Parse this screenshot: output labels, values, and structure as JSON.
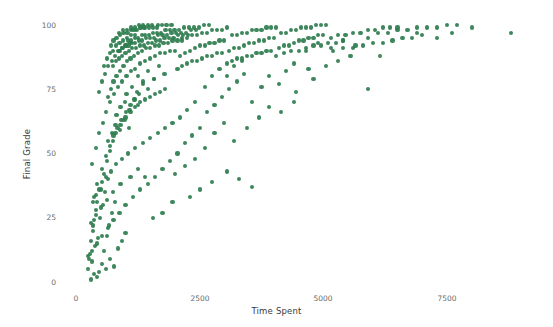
{
  "chart_data": {
    "type": "scatter",
    "title": "",
    "xlabel": "Time Spent",
    "ylabel": "Final Grade",
    "xlim": [
      -320,
      9400
    ],
    "ylim": [
      -5,
      105
    ],
    "xticks": [
      0,
      2500,
      5000,
      7500
    ],
    "xtick_labels": [
      "0",
      "2500",
      "5000",
      "7500"
    ],
    "yticks": [
      0,
      25,
      50,
      75,
      100
    ],
    "ytick_labels": [
      "0",
      "25",
      "50",
      "75",
      "100"
    ],
    "grid": false,
    "legend": false,
    "marker_color": "#2e7d4f",
    "marker_size": 4,
    "background_color": "#ffffff",
    "n_points": 470,
    "points": [
      [
        300,
        1
      ],
      [
        360,
        3
      ],
      [
        250,
        5
      ],
      [
        420,
        2
      ],
      [
        330,
        8
      ],
      [
        470,
        4
      ],
      [
        280,
        11
      ],
      [
        520,
        7
      ],
      [
        390,
        14
      ],
      [
        600,
        5
      ],
      [
        450,
        17
      ],
      [
        340,
        20
      ],
      [
        560,
        12
      ],
      [
        690,
        9
      ],
      [
        300,
        23
      ],
      [
        480,
        25
      ],
      [
        620,
        18
      ],
      [
        770,
        6
      ],
      [
        410,
        28
      ],
      [
        540,
        30
      ],
      [
        660,
        22
      ],
      [
        850,
        13
      ],
      [
        360,
        33
      ],
      [
        580,
        35
      ],
      [
        720,
        27
      ],
      [
        930,
        16
      ],
      [
        430,
        38
      ],
      [
        640,
        40
      ],
      [
        790,
        31
      ],
      [
        1000,
        19
      ],
      [
        250,
        10
      ],
      [
        310,
        16
      ],
      [
        370,
        24
      ],
      [
        430,
        31
      ],
      [
        500,
        36
      ],
      [
        560,
        42
      ],
      [
        620,
        47
      ],
      [
        680,
        51
      ],
      [
        740,
        55
      ],
      [
        800,
        58
      ],
      [
        900,
        61
      ],
      [
        1000,
        64
      ],
      [
        1100,
        66
      ],
      [
        1200,
        68
      ],
      [
        1300,
        70
      ],
      [
        1400,
        71
      ],
      [
        1500,
        72
      ],
      [
        1600,
        73
      ],
      [
        1700,
        74
      ],
      [
        1800,
        75
      ],
      [
        520,
        44
      ],
      [
        600,
        49
      ],
      [
        680,
        53
      ],
      [
        760,
        57
      ],
      [
        840,
        60
      ],
      [
        920,
        63
      ],
      [
        1010,
        66
      ],
      [
        1100,
        69
      ],
      [
        1190,
        71
      ],
      [
        1280,
        73
      ],
      [
        330,
        46
      ],
      [
        400,
        52
      ],
      [
        470,
        58
      ],
      [
        540,
        62
      ],
      [
        610,
        66
      ],
      [
        690,
        70
      ],
      [
        770,
        73
      ],
      [
        850,
        76
      ],
      [
        930,
        78
      ],
      [
        1020,
        80
      ],
      [
        1110,
        82
      ],
      [
        1200,
        83
      ],
      [
        1300,
        85
      ],
      [
        1400,
        86
      ],
      [
        1500,
        87
      ],
      [
        1600,
        88
      ],
      [
        1700,
        89
      ],
      [
        1800,
        89
      ],
      [
        1900,
        90
      ],
      [
        2000,
        90
      ],
      [
        640,
        72
      ],
      [
        700,
        75
      ],
      [
        760,
        78
      ],
      [
        820,
        80
      ],
      [
        890,
        82
      ],
      [
        960,
        84
      ],
      [
        1030,
        86
      ],
      [
        1100,
        87
      ],
      [
        1180,
        88
      ],
      [
        1260,
        89
      ],
      [
        1340,
        90
      ],
      [
        1420,
        91
      ],
      [
        1500,
        91
      ],
      [
        1590,
        92
      ],
      [
        1680,
        92
      ],
      [
        1770,
        93
      ],
      [
        1860,
        93
      ],
      [
        1950,
        94
      ],
      [
        2050,
        94
      ],
      [
        2150,
        94
      ],
      [
        750,
        84
      ],
      [
        810,
        86
      ],
      [
        870,
        87
      ],
      [
        930,
        88
      ],
      [
        1000,
        89
      ],
      [
        1070,
        90
      ],
      [
        1140,
        91
      ],
      [
        1210,
        91
      ],
      [
        1290,
        92
      ],
      [
        1370,
        92
      ],
      [
        1450,
        93
      ],
      [
        1530,
        93
      ],
      [
        1610,
        94
      ],
      [
        1700,
        94
      ],
      [
        1790,
        95
      ],
      [
        1880,
        95
      ],
      [
        1970,
        95
      ],
      [
        2060,
        96
      ],
      [
        2160,
        96
      ],
      [
        2260,
        96
      ],
      [
        880,
        90
      ],
      [
        940,
        91
      ],
      [
        1000,
        92
      ],
      [
        1060,
        92
      ],
      [
        1130,
        93
      ],
      [
        1200,
        93
      ],
      [
        1270,
        94
      ],
      [
        1340,
        94
      ],
      [
        1420,
        95
      ],
      [
        1500,
        95
      ],
      [
        1580,
        95
      ],
      [
        1660,
        96
      ],
      [
        1750,
        96
      ],
      [
        1840,
        96
      ],
      [
        1930,
        97
      ],
      [
        2020,
        97
      ],
      [
        2120,
        97
      ],
      [
        2220,
        97
      ],
      [
        2320,
        98
      ],
      [
        2420,
        98
      ],
      [
        1050,
        94
      ],
      [
        1120,
        94
      ],
      [
        1190,
        95
      ],
      [
        1260,
        95
      ],
      [
        1330,
        96
      ],
      [
        1400,
        96
      ],
      [
        1480,
        96
      ],
      [
        1560,
        97
      ],
      [
        1640,
        97
      ],
      [
        1720,
        97
      ],
      [
        1810,
        98
      ],
      [
        1900,
        98
      ],
      [
        1990,
        98
      ],
      [
        2080,
        98
      ],
      [
        2180,
        99
      ],
      [
        2280,
        99
      ],
      [
        2380,
        99
      ],
      [
        2480,
        99
      ],
      [
        2580,
        100
      ],
      [
        2690,
        100
      ],
      [
        1150,
        98
      ],
      [
        1230,
        98
      ],
      [
        1310,
        99
      ],
      [
        1390,
        99
      ],
      [
        1470,
        99
      ],
      [
        1560,
        99
      ],
      [
        1650,
        100
      ],
      [
        1740,
        100
      ],
      [
        1830,
        100
      ],
      [
        1930,
        100
      ],
      [
        870,
        97
      ],
      [
        950,
        98
      ],
      [
        1030,
        98
      ],
      [
        1110,
        99
      ],
      [
        1190,
        99
      ],
      [
        1270,
        100
      ],
      [
        1360,
        100
      ],
      [
        1450,
        100
      ],
      [
        1540,
        100
      ],
      [
        1640,
        99
      ],
      [
        700,
        92
      ],
      [
        760,
        94
      ],
      [
        820,
        95
      ],
      [
        890,
        96
      ],
      [
        960,
        97
      ],
      [
        1040,
        97
      ],
      [
        1120,
        98
      ],
      [
        1200,
        98
      ],
      [
        1290,
        99
      ],
      [
        1380,
        99
      ],
      [
        560,
        84
      ],
      [
        620,
        87
      ],
      [
        680,
        89
      ],
      [
        740,
        90
      ],
      [
        810,
        92
      ],
      [
        880,
        93
      ],
      [
        950,
        94
      ],
      [
        1030,
        95
      ],
      [
        1110,
        96
      ],
      [
        1190,
        96
      ],
      [
        470,
        74
      ],
      [
        530,
        78
      ],
      [
        590,
        81
      ],
      [
        650,
        84
      ],
      [
        720,
        86
      ],
      [
        790,
        88
      ],
      [
        860,
        90
      ],
      [
        930,
        91
      ],
      [
        1010,
        92
      ],
      [
        1090,
        93
      ],
      [
        2100,
        88
      ],
      [
        2200,
        89
      ],
      [
        2300,
        90
      ],
      [
        2400,
        91
      ],
      [
        2500,
        92
      ],
      [
        2600,
        92
      ],
      [
        2700,
        93
      ],
      [
        2800,
        93
      ],
      [
        2900,
        94
      ],
      [
        3000,
        94
      ],
      [
        2150,
        95
      ],
      [
        2250,
        95
      ],
      [
        2350,
        96
      ],
      [
        2450,
        96
      ],
      [
        2550,
        97
      ],
      [
        2650,
        97
      ],
      [
        2750,
        98
      ],
      [
        2850,
        98
      ],
      [
        2950,
        98
      ],
      [
        3050,
        99
      ],
      [
        2050,
        83
      ],
      [
        2150,
        84
      ],
      [
        2250,
        85
      ],
      [
        2350,
        86
      ],
      [
        2450,
        86
      ],
      [
        2550,
        87
      ],
      [
        2650,
        88
      ],
      [
        2750,
        88
      ],
      [
        2850,
        89
      ],
      [
        2950,
        89
      ],
      [
        3100,
        90
      ],
      [
        3200,
        91
      ],
      [
        3300,
        91
      ],
      [
        3400,
        92
      ],
      [
        3500,
        93
      ],
      [
        3600,
        93
      ],
      [
        3700,
        94
      ],
      [
        3800,
        94
      ],
      [
        3900,
        95
      ],
      [
        4000,
        95
      ],
      [
        3150,
        96
      ],
      [
        3250,
        96
      ],
      [
        3350,
        97
      ],
      [
        3450,
        97
      ],
      [
        3550,
        98
      ],
      [
        3650,
        98
      ],
      [
        3750,
        98
      ],
      [
        3850,
        99
      ],
      [
        3950,
        99
      ],
      [
        4050,
        99
      ],
      [
        3050,
        85
      ],
      [
        3150,
        86
      ],
      [
        3250,
        87
      ],
      [
        3350,
        87
      ],
      [
        3450,
        88
      ],
      [
        3550,
        88
      ],
      [
        3650,
        89
      ],
      [
        3750,
        89
      ],
      [
        3850,
        90
      ],
      [
        3950,
        90
      ],
      [
        4100,
        91
      ],
      [
        4200,
        92
      ],
      [
        4300,
        92
      ],
      [
        4400,
        93
      ],
      [
        4500,
        94
      ],
      [
        4600,
        94
      ],
      [
        4700,
        95
      ],
      [
        4800,
        95
      ],
      [
        4900,
        96
      ],
      [
        5000,
        96
      ],
      [
        4150,
        97
      ],
      [
        4250,
        97
      ],
      [
        4350,
        98
      ],
      [
        4450,
        98
      ],
      [
        4550,
        99
      ],
      [
        4650,
        99
      ],
      [
        4750,
        99
      ],
      [
        4850,
        100
      ],
      [
        4950,
        100
      ],
      [
        5050,
        100
      ],
      [
        4050,
        88
      ],
      [
        4200,
        89
      ],
      [
        4350,
        90
      ],
      [
        4500,
        90
      ],
      [
        4650,
        91
      ],
      [
        4800,
        92
      ],
      [
        4950,
        92
      ],
      [
        5100,
        93
      ],
      [
        5250,
        93
      ],
      [
        5400,
        94
      ],
      [
        5150,
        95
      ],
      [
        5300,
        96
      ],
      [
        5450,
        96
      ],
      [
        5600,
        97
      ],
      [
        5750,
        97
      ],
      [
        5900,
        98
      ],
      [
        6050,
        98
      ],
      [
        6200,
        99
      ],
      [
        6350,
        99
      ],
      [
        6500,
        99
      ],
      [
        5200,
        90
      ],
      [
        5400,
        91
      ],
      [
        5600,
        91
      ],
      [
        5800,
        92
      ],
      [
        6000,
        93
      ],
      [
        6200,
        93
      ],
      [
        6400,
        94
      ],
      [
        6600,
        95
      ],
      [
        6800,
        95
      ],
      [
        7000,
        96
      ],
      [
        6100,
        97
      ],
      [
        6300,
        97
      ],
      [
        6500,
        98
      ],
      [
        6700,
        98
      ],
      [
        6900,
        99
      ],
      [
        7100,
        99
      ],
      [
        7300,
        99
      ],
      [
        7500,
        100
      ],
      [
        7700,
        100
      ],
      [
        8000,
        99
      ],
      [
        5900,
        75
      ],
      [
        6150,
        88
      ],
      [
        6900,
        97
      ],
      [
        7300,
        95
      ],
      [
        7600,
        97
      ],
      [
        8800,
        97
      ],
      [
        4800,
        79
      ],
      [
        5050,
        84
      ],
      [
        5300,
        86
      ],
      [
        5550,
        88
      ],
      [
        4450,
        74
      ],
      [
        4700,
        83
      ],
      [
        3550,
        70
      ],
      [
        3750,
        76
      ],
      [
        3900,
        80
      ],
      [
        4100,
        77
      ],
      [
        4250,
        82
      ],
      [
        4400,
        85
      ],
      [
        2950,
        72
      ],
      [
        3100,
        75
      ],
      [
        3250,
        78
      ],
      [
        3400,
        81
      ],
      [
        2800,
        69
      ],
      [
        2650,
        66
      ],
      [
        2500,
        60
      ],
      [
        2350,
        57
      ],
      [
        2200,
        54
      ],
      [
        2050,
        50
      ],
      [
        1900,
        47
      ],
      [
        1750,
        44
      ],
      [
        1600,
        41
      ],
      [
        1450,
        38
      ],
      [
        1300,
        36
      ],
      [
        1150,
        33
      ],
      [
        1000,
        30
      ],
      [
        880,
        27
      ],
      [
        760,
        24
      ],
      [
        640,
        21
      ],
      [
        520,
        18
      ],
      [
        420,
        15
      ],
      [
        330,
        12
      ],
      [
        260,
        9
      ],
      [
        2600,
        76
      ],
      [
        2750,
        80
      ],
      [
        2900,
        83
      ],
      [
        3050,
        80
      ],
      [
        3200,
        84
      ],
      [
        3350,
        86
      ],
      [
        2400,
        70
      ],
      [
        2250,
        67
      ],
      [
        2100,
        64
      ],
      [
        1950,
        62
      ],
      [
        1800,
        60
      ],
      [
        1650,
        58
      ],
      [
        1500,
        56
      ],
      [
        1350,
        54
      ],
      [
        1200,
        52
      ],
      [
        1050,
        50
      ],
      [
        930,
        48
      ],
      [
        810,
        46
      ],
      [
        700,
        43
      ],
      [
        610,
        41
      ],
      [
        530,
        39
      ],
      [
        460,
        36
      ],
      [
        400,
        34
      ],
      [
        350,
        31
      ],
      [
        1950,
        31
      ],
      [
        1750,
        27
      ],
      [
        1550,
        25
      ],
      [
        1400,
        41
      ],
      [
        1250,
        44
      ],
      [
        1100,
        41
      ],
      [
        900,
        38
      ],
      [
        750,
        35
      ],
      [
        620,
        32
      ],
      [
        500,
        29
      ],
      [
        410,
        26
      ],
      [
        340,
        22
      ],
      [
        1250,
        80
      ],
      [
        1350,
        78
      ],
      [
        1460,
        82
      ],
      [
        1570,
        79
      ],
      [
        1680,
        84
      ],
      [
        1790,
        81
      ],
      [
        1020,
        73
      ],
      [
        1130,
        76
      ],
      [
        1240,
        74
      ],
      [
        1350,
        77
      ],
      [
        1460,
        75
      ],
      [
        1570,
        79
      ],
      [
        820,
        65
      ],
      [
        900,
        68
      ],
      [
        990,
        70
      ],
      [
        1080,
        67
      ],
      [
        1170,
        71
      ],
      [
        1260,
        69
      ],
      [
        640,
        55
      ],
      [
        720,
        58
      ],
      [
        800,
        61
      ],
      [
        890,
        59
      ],
      [
        980,
        63
      ],
      [
        1070,
        60
      ],
      [
        2800,
        58
      ],
      [
        3000,
        62
      ],
      [
        3200,
        55
      ],
      [
        3450,
        60
      ],
      [
        3700,
        64
      ],
      [
        2600,
        52
      ],
      [
        3900,
        68
      ],
      [
        4150,
        66
      ],
      [
        4400,
        70
      ],
      [
        2400,
        48
      ],
      [
        2200,
        45
      ],
      [
        2000,
        42
      ],
      [
        4650,
        90
      ],
      [
        4900,
        93
      ],
      [
        5150,
        91
      ],
      [
        5400,
        94
      ],
      [
        5650,
        92
      ],
      [
        5900,
        95
      ],
      [
        3050,
        43
      ],
      [
        3300,
        40
      ],
      [
        2750,
        39
      ],
      [
        2500,
        36
      ],
      [
        2300,
        33
      ],
      [
        3550,
        37
      ]
    ]
  }
}
